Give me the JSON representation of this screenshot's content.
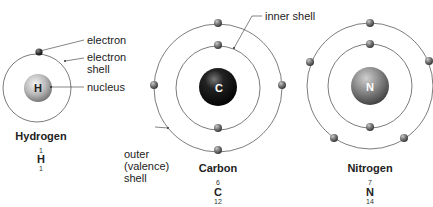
{
  "labels": {
    "electron": "electron",
    "electron_shell_1": "electron",
    "electron_shell_2": "shell",
    "nucleus": "nucleus",
    "inner_shell": "inner shell",
    "outer_1": "outer",
    "outer_2": "(valence)",
    "outer_3": "shell"
  },
  "atoms": [
    {
      "name": "Hydrogen",
      "symbol": "H",
      "atomic_number": "1",
      "mass_number": "1"
    },
    {
      "name": "Carbon",
      "symbol": "C",
      "atomic_number": "6",
      "mass_number": "12"
    },
    {
      "name": "Nitrogen",
      "symbol": "N",
      "atomic_number": "7",
      "mass_number": "14"
    }
  ]
}
